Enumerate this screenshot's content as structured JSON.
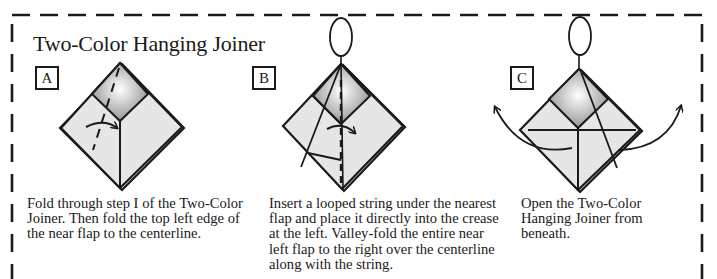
{
  "title": "Two-Color Hanging Joiner",
  "steps": [
    {
      "label": "A",
      "caption": "Fold through step I of the Two-Color Joiner. Then fold the top left edge of the near flap to the centerline.",
      "caption_lines": [
        "Fold through step I of the Two-Color",
        "Joiner. Then fold the top left edge of",
        "the near flap to the centerline."
      ]
    },
    {
      "label": "B",
      "caption": "Insert a looped string under the nearest flap and place it directly into the crease at the left. Valley-fold the entire near left flap to the right over the centerline along with the string.",
      "caption_lines": [
        "Insert a looped string under the nearest",
        "flap and place it directly into the crease",
        "at the left. Valley-fold the entire near",
        "left flap to the right over the centerline",
        "along with the string."
      ]
    },
    {
      "label": "C",
      "caption": "Open the Two-Color Hanging Joiner from beneath.",
      "caption_lines": [
        "Open the Two-Color",
        "Hanging Joiner from",
        "beneath."
      ]
    }
  ],
  "colors": {
    "paper_light": "#e6e6e6",
    "paper_dark": "#8c8c8c",
    "highlight": "#ffffff",
    "line": "#1a1a1a"
  }
}
